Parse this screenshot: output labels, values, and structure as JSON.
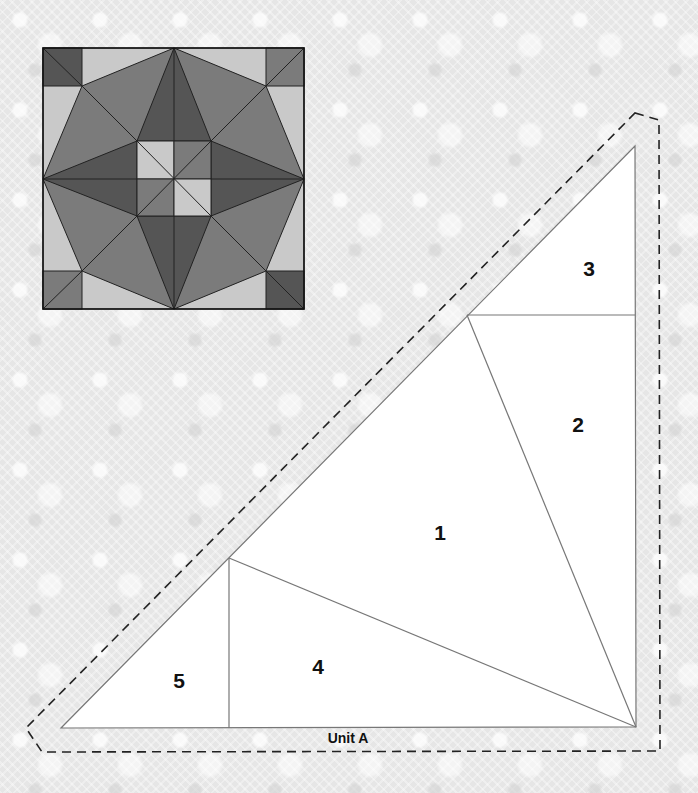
{
  "colors": {
    "light": "#c9c9c9",
    "medium": "#7b7b7b",
    "dark": "#555555",
    "outline": "#222222",
    "pattern_fill": "#ffffff",
    "pattern_line": "#777777",
    "seam_allowance": "#222222"
  },
  "block_preview": {
    "description": "Finished quilt block preview",
    "position": {
      "x": 43,
      "y": 48,
      "size": 261
    }
  },
  "pattern": {
    "unit_label": "Unit A",
    "pieces": [
      {
        "id": "1",
        "label": "1",
        "x": 440,
        "y": 540
      },
      {
        "id": "2",
        "label": "2",
        "x": 578,
        "y": 432
      },
      {
        "id": "3",
        "label": "3",
        "x": 589,
        "y": 276
      },
      {
        "id": "4",
        "label": "4",
        "x": 318,
        "y": 674
      },
      {
        "id": "5",
        "label": "5",
        "x": 179,
        "y": 688
      }
    ]
  }
}
